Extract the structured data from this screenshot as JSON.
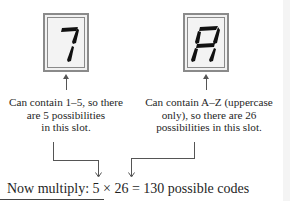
{
  "slots": [
    {
      "glyph": "1",
      "caption_lines": [
        "Can contain 1–5, so there",
        "are 5 possibilities",
        "in this slot."
      ],
      "possibilities": 5
    },
    {
      "glyph": "A",
      "caption_lines": [
        "Can contain A–Z (uppercase",
        "only), so there are 26",
        "possibilities in this slot."
      ],
      "possibilities": 26
    }
  ],
  "equation": {
    "text": "Now multiply: 5 × 26 = 130 possible codes"
  },
  "colors": {
    "slot_border": "#8a8a8a",
    "slot_fill": "#f1f1f1",
    "segment": "#111111",
    "line": "#555555"
  }
}
